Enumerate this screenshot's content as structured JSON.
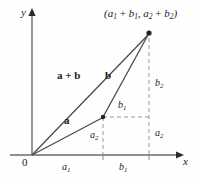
{
  "figure": {
    "background_color": "#fefefe",
    "line_color": "#555555",
    "dash_color": "#8a8a8a",
    "text_color": "#1a1a1a"
  },
  "axes": {
    "y_label": "y",
    "x_label": "x",
    "origin_label": "0"
  },
  "points": {
    "sum_point_label_parts": {
      "open": "(",
      "a1": "a",
      "a1_sub": "1",
      "plus1": " + ",
      "b1": "b",
      "b1_sub": "1",
      "comma": ", ",
      "a2": "a",
      "a2_sub": "2",
      "plus2": " + ",
      "b2": "b",
      "b2_sub": "2",
      "close": ")"
    },
    "sum_point_label_text": "(a1 + b1, a2 + b2)"
  },
  "vectors": {
    "sum_label": "a + b",
    "a_label": "a",
    "b_label": "b"
  },
  "components": {
    "a1_axis": "a",
    "a1_axis_sub": "1",
    "b1_axis": "b",
    "b1_axis_sub": "1",
    "a2_mid": "a",
    "a2_mid_sub": "2",
    "b1_mid": "b",
    "b1_mid_sub": "1",
    "b2_right": "b",
    "b2_right_sub": "2",
    "a2_right": "a",
    "a2_right_sub": "2"
  },
  "geometry": {
    "origin": [
      32,
      155
    ],
    "mid_vertex": [
      103,
      117
    ],
    "sum_vertex": [
      149,
      33
    ],
    "x_axis_end": [
      182,
      155
    ],
    "y_axis_top": [
      32,
      10
    ]
  }
}
